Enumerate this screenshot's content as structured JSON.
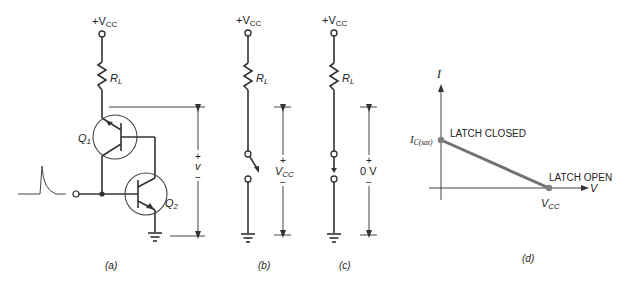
{
  "figure": {
    "panels": {
      "a": {
        "caption": "(a)",
        "supply": "+V",
        "supply_sub": "CC",
        "resistor": "R",
        "resistor_sub": "L",
        "transistor1": "Q",
        "transistor1_sub": "1",
        "transistor2": "Q",
        "transistor2_sub": "2",
        "voltage_plus": "+",
        "voltage_label": "v",
        "voltage_minus": "−"
      },
      "b": {
        "caption": "(b)",
        "supply": "+V",
        "supply_sub": "CC",
        "resistor": "R",
        "resistor_sub": "L",
        "voltage_plus": "+",
        "voltage_label": "V",
        "voltage_label_sub": "CC",
        "voltage_minus": "−",
        "switch_state": "open"
      },
      "c": {
        "caption": "(c)",
        "supply": "+V",
        "supply_sub": "CC",
        "resistor": "R",
        "resistor_sub": "L",
        "voltage_plus": "+",
        "voltage_label": "0 V",
        "voltage_minus": "−",
        "switch_state": "closed"
      },
      "d": {
        "caption": "(d)",
        "y_axis": "I",
        "x_axis": "V",
        "y_intercept": "I",
        "y_intercept_sub": "C(sat)",
        "x_intercept": "V",
        "x_intercept_sub": "CC",
        "point_closed": "LATCH CLOSED",
        "point_open": "LATCH OPEN",
        "line_color": "#707070"
      }
    }
  }
}
